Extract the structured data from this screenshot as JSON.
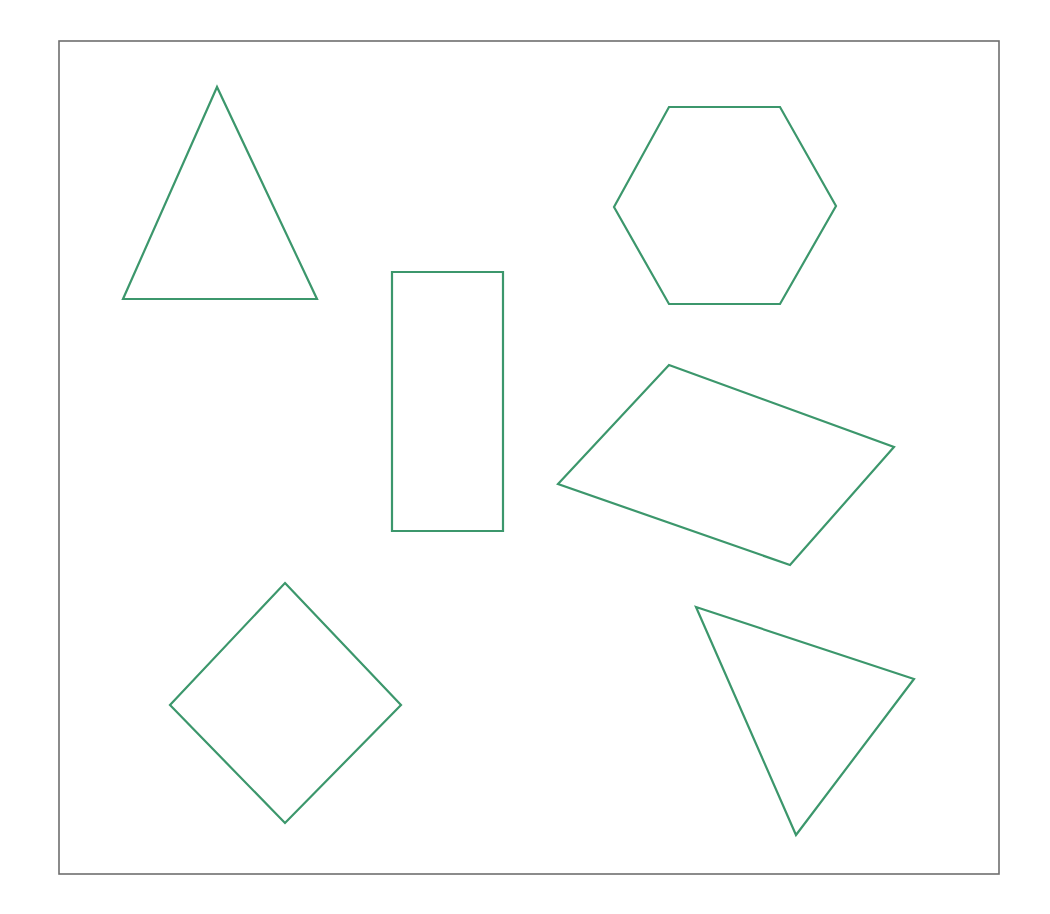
{
  "figure": {
    "background_color": "#ffffff",
    "canvas": {
      "width": 1050,
      "height": 914
    }
  },
  "frame": {
    "name": "border-frame",
    "x": 59,
    "y": 41,
    "width": 940,
    "height": 833,
    "stroke_color": "#6e6e6e",
    "stroke_width": 1.6,
    "fill": "none"
  },
  "style": {
    "shape_stroke_color": "#3c976c",
    "shape_stroke_width": 2.2,
    "shape_fill": "none"
  },
  "shapes": [
    {
      "id": "triangle-isosceles",
      "label": "Isosceles triangle",
      "kind": "polygon",
      "sides": 3,
      "points": "217,87 123,299 317,299",
      "stroke_color": "#3c976c",
      "stroke_width": 2.2
    },
    {
      "id": "hexagon",
      "label": "Regular hexagon",
      "kind": "polygon",
      "sides": 6,
      "points": "669,107 780,107 836,206 780,304 669,304 614,207",
      "stroke_color": "#3c976c",
      "stroke_width": 2.2
    },
    {
      "id": "rectangle-upright",
      "label": "Upright rectangle",
      "kind": "polygon",
      "sides": 4,
      "points": "392,272 503,272 503,531 392,531",
      "stroke_color": "#3c976c",
      "stroke_width": 2.2
    },
    {
      "id": "rectangle-rotated",
      "label": "Rotated rectangle",
      "kind": "polygon",
      "sides": 4,
      "points": "669,365 894,447 790,565 558,484",
      "stroke_color": "#3c976c",
      "stroke_width": 2.2
    },
    {
      "id": "square-diamond",
      "label": "Square rotated 45 degrees (diamond)",
      "kind": "polygon",
      "sides": 4,
      "points": "285,583 401,705 285,823 170,705",
      "stroke_color": "#3c976c",
      "stroke_width": 2.2
    },
    {
      "id": "triangle-scalene",
      "label": "Scalene triangle",
      "kind": "polygon",
      "sides": 3,
      "points": "696,607 914,679 796,835",
      "stroke_color": "#3c976c",
      "stroke_width": 2.2
    }
  ]
}
